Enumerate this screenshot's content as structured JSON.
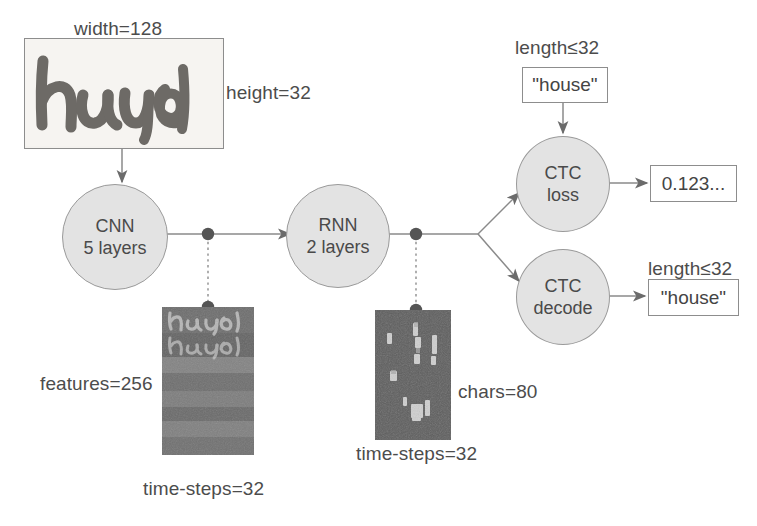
{
  "diagram": {
    "input": {
      "width_label": "width=128",
      "height_label": "height=32",
      "image_text": "house"
    },
    "nodes": {
      "cnn": {
        "line1": "CNN",
        "line2": "5 layers"
      },
      "rnn": {
        "line1": "RNN",
        "line2": "2 layers"
      },
      "ctc_loss": {
        "line1": "CTC",
        "line2": "loss"
      },
      "ctc_decode": {
        "line1": "CTC",
        "line2": "decode"
      }
    },
    "feature_map": {
      "features_label": "features=256",
      "timesteps_label": "time-steps=32",
      "overlay_text_1": "house",
      "overlay_text_2": "house"
    },
    "rnn_matrix": {
      "chars_label": "chars=80",
      "timesteps_label": "time-steps=32"
    },
    "ground_truth": {
      "length_label": "length≤32",
      "value": "\"house\""
    },
    "loss_output": {
      "value": "0.123..."
    },
    "decoded_output": {
      "length_label": "length≤32",
      "value": "\"house\""
    },
    "colors": {
      "node_fill": "#e3e3e3",
      "node_stroke": "#9a9a9a",
      "text": "#4c4c4c",
      "line": "#8a8a8a",
      "dot": "#555555",
      "feature_map_dark": "#6f6f6f",
      "rnn_matrix_dark": "#5e5e5e"
    }
  }
}
